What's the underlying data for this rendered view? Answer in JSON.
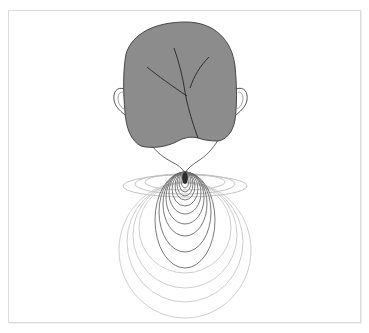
{
  "figure": {
    "subject": "back of head with field contour lines emanating from base of neck point",
    "colors": {
      "background": "#ffffff",
      "frame_border": "#dcdcdc",
      "hair_fill": "#8c8c8c",
      "hair_outline": "#3a3a3a",
      "skin_outline": "#555555",
      "skin_fill": "#ffffff",
      "source_point": "#2e2e2e",
      "inner_contours": "#6a6a6a",
      "outer_contours": "#c8c8c8",
      "horizontal_contours": "#bdbdbd"
    },
    "source_point": {
      "cx": 185,
      "cy": 178,
      "rx": 3,
      "ry": 6
    },
    "inner_contours": [
      {
        "cx": 185,
        "cy": 180,
        "rx": 4,
        "ry": 8
      },
      {
        "cx": 185,
        "cy": 182,
        "rx": 6,
        "ry": 10
      },
      {
        "cx": 185,
        "cy": 184,
        "rx": 8,
        "ry": 12
      },
      {
        "cx": 185,
        "cy": 186,
        "rx": 10,
        "ry": 14
      },
      {
        "cx": 185,
        "cy": 189,
        "rx": 13,
        "ry": 17
      },
      {
        "cx": 185,
        "cy": 193,
        "rx": 16,
        "ry": 21
      },
      {
        "cx": 185,
        "cy": 198,
        "rx": 19,
        "ry": 26
      },
      {
        "cx": 185,
        "cy": 204,
        "rx": 22,
        "ry": 32
      },
      {
        "cx": 185,
        "cy": 212,
        "rx": 26,
        "ry": 40
      },
      {
        "cx": 185,
        "cy": 220,
        "rx": 30,
        "ry": 48
      }
    ],
    "outer_contours": [
      {
        "cx": 185,
        "cy": 228,
        "rx": 46,
        "ry": 45
      },
      {
        "cx": 185,
        "cy": 235,
        "rx": 52,
        "ry": 53
      },
      {
        "cx": 185,
        "cy": 242,
        "rx": 58,
        "ry": 60
      },
      {
        "cx": 185,
        "cy": 250,
        "rx": 66,
        "ry": 68
      }
    ],
    "horizontal_contours": [
      {
        "cx": 185,
        "cy": 182,
        "rx": 40,
        "ry": 8
      },
      {
        "cx": 185,
        "cy": 184,
        "rx": 50,
        "ry": 10
      },
      {
        "cx": 185,
        "cy": 186,
        "rx": 62,
        "ry": 11
      }
    ]
  }
}
